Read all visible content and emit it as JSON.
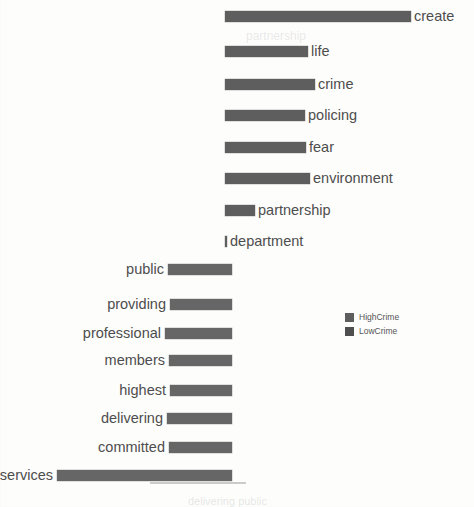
{
  "chart_data": {
    "type": "bar",
    "title": "",
    "subtitle": "",
    "xlabel": "",
    "ylabel": "",
    "orientation": "horizontal",
    "layout": "diverging",
    "grid": false,
    "legend_position": "center-right",
    "axis_visible": false,
    "tick_labels": [],
    "series": [
      {
        "name": "HighCrime",
        "color": "#5e5e5e",
        "direction": "right",
        "categories": [
          "create",
          "life",
          "crime",
          "policing",
          "fear",
          "environment",
          "partnership",
          "department"
        ],
        "values": [
          186,
          83,
          90,
          80,
          81,
          85,
          30,
          1
        ]
      },
      {
        "name": "LowCrime",
        "color": "#4f4f4f",
        "direction": "left",
        "categories": [
          "public",
          "providing",
          "professional",
          "members",
          "highest",
          "delivering",
          "committed",
          "services"
        ],
        "values": [
          64,
          62,
          67,
          63,
          62,
          65,
          63,
          175
        ]
      }
    ]
  },
  "legend": {
    "items": [
      {
        "label": "HighCrime",
        "color": "#5e5e5e"
      },
      {
        "label": "LowCrime",
        "color": "#4f4f4f"
      }
    ]
  },
  "upper_rows": [
    {
      "label": "create",
      "bar_left": 225,
      "bar_width": 186,
      "label_x": 414,
      "y": 11
    },
    {
      "label": "life",
      "bar_left": 225,
      "bar_width": 83,
      "label_x": 311,
      "y": 46
    },
    {
      "label": "crime",
      "bar_left": 225,
      "bar_width": 90,
      "label_x": 318,
      "y": 79
    },
    {
      "label": "policing",
      "bar_left": 225,
      "bar_width": 80,
      "label_x": 308,
      "y": 110
    },
    {
      "label": "fear",
      "bar_left": 225,
      "bar_width": 81,
      "label_x": 309,
      "y": 142
    },
    {
      "label": "environment",
      "bar_left": 225,
      "bar_width": 85,
      "label_x": 313,
      "y": 173
    },
    {
      "label": "partnership",
      "bar_left": 225,
      "bar_width": 30,
      "label_x": 258,
      "y": 205
    },
    {
      "label": "department",
      "bar_left": 225,
      "bar_width": 2,
      "label_x": 230,
      "y": 236
    }
  ],
  "lower_rows": [
    {
      "label": "public",
      "bar_left": 168,
      "bar_width": 64,
      "label_right": 164,
      "y": 264
    },
    {
      "label": "providing",
      "bar_left": 170,
      "bar_width": 62,
      "label_right": 166,
      "y": 299
    },
    {
      "label": "professional",
      "bar_left": 165,
      "bar_width": 67,
      "label_right": 161,
      "y": 328
    },
    {
      "label": "members",
      "bar_left": 169,
      "bar_width": 63,
      "label_right": 165,
      "y": 355
    },
    {
      "label": "highest",
      "bar_left": 170,
      "bar_width": 62,
      "label_right": 166,
      "y": 385
    },
    {
      "label": "delivering",
      "bar_left": 167,
      "bar_width": 65,
      "label_right": 163,
      "y": 413
    },
    {
      "label": "committed",
      "bar_left": 169,
      "bar_width": 63,
      "label_right": 165,
      "y": 442
    },
    {
      "label": "services",
      "bar_left": 57,
      "bar_width": 175,
      "label_right": 53,
      "y": 470
    }
  ],
  "artifacts": {
    "ghost_top": "partnership",
    "ghost_bottom": "delivering public"
  }
}
